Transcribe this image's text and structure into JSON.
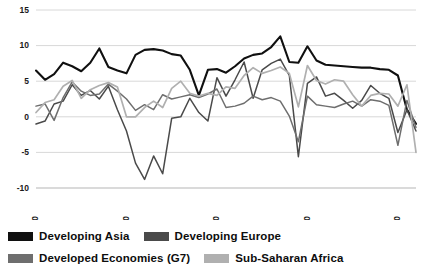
{
  "chart_data": {
    "type": "line",
    "title": "",
    "subtitle": "",
    "xlabel": "",
    "ylabel": "",
    "xlim": [
      1980,
      2022
    ],
    "ylim": [
      -10,
      15
    ],
    "grid": "horizontal",
    "legend_position": "bottom",
    "yticks": [
      15,
      10,
      5,
      0,
      -5,
      -10
    ],
    "ytick_labels": [
      "15",
      "10",
      "5",
      "0",
      "-5",
      "-10"
    ],
    "xticks": [
      1980,
      1990,
      2000,
      2010,
      2020
    ],
    "xtick_labels": [
      "1980",
      "1990",
      "2000",
      "2010",
      "2020"
    ],
    "x": [
      1980,
      1981,
      1982,
      1983,
      1984,
      1985,
      1986,
      1987,
      1988,
      1989,
      1990,
      1991,
      1992,
      1993,
      1994,
      1995,
      1996,
      1997,
      1998,
      1999,
      2000,
      2001,
      2002,
      2003,
      2004,
      2005,
      2006,
      2007,
      2008,
      2009,
      2010,
      2011,
      2012,
      2013,
      2014,
      2015,
      2016,
      2017,
      2018,
      2019,
      2020,
      2021,
      2022
    ],
    "series": [
      {
        "name": "Developing Asia",
        "color": "#101010",
        "width": 2.1,
        "values": [
          6.5,
          5.2,
          6.0,
          7.6,
          7.1,
          6.4,
          7.6,
          9.6,
          7.0,
          6.5,
          6.1,
          8.7,
          9.4,
          9.5,
          9.3,
          8.8,
          8.6,
          6.6,
          3.0,
          6.6,
          6.7,
          6.2,
          7.1,
          8.2,
          8.7,
          8.9,
          9.8,
          11.3,
          7.7,
          7.6,
          9.9,
          7.9,
          7.3,
          7.2,
          7.1,
          7.0,
          6.9,
          6.9,
          6.7,
          6.6,
          5.8,
          1.0,
          -1.0
        ]
      },
      {
        "name": "Developing Europe",
        "color": "#4a4a4a",
        "width": 1.5,
        "values": [
          -1.0,
          -0.6,
          1.8,
          2.2,
          4.5,
          3.0,
          3.7,
          2.5,
          4.3,
          1.0,
          -2.0,
          -6.5,
          -8.8,
          -5.5,
          -8.0,
          -0.2,
          0.0,
          2.6,
          0.6,
          -0.6,
          5.5,
          2.9,
          5.2,
          7.7,
          2.6,
          6.6,
          7.5,
          8.1,
          5.8,
          -5.6,
          4.7,
          5.6,
          2.9,
          3.3,
          2.3,
          1.2,
          2.3,
          4.4,
          3.3,
          2.6,
          -2.2,
          1.0,
          -2.0
        ]
      },
      {
        "name": "Developed Economies (G7)",
        "color": "#6e6e6e",
        "width": 1.5,
        "values": [
          1.5,
          1.8,
          -0.5,
          2.7,
          4.9,
          3.6,
          3.0,
          3.2,
          4.6,
          3.6,
          2.5,
          0.9,
          1.7,
          1.0,
          3.1,
          2.5,
          2.8,
          3.1,
          2.7,
          3.2,
          3.9,
          1.3,
          1.5,
          1.9,
          2.9,
          2.4,
          2.7,
          2.2,
          0.1,
          -3.5,
          2.9,
          1.7,
          1.5,
          1.3,
          1.8,
          2.2,
          1.5,
          2.4,
          2.2,
          1.6,
          -4.0,
          2.3,
          -1.5
        ]
      },
      {
        "name": "Sub-Saharan Africa",
        "color": "#b0b0b0",
        "width": 1.7,
        "values": [
          0.6,
          2.0,
          2.4,
          4.3,
          5.1,
          2.6,
          3.8,
          4.4,
          4.8,
          4.2,
          0.0,
          0.0,
          1.3,
          2.2,
          1.3,
          4.0,
          5.0,
          3.3,
          2.9,
          3.3,
          3.0,
          4.2,
          4.0,
          5.8,
          6.9,
          6.1,
          6.5,
          7.0,
          6.1,
          1.4,
          7.2,
          5.1,
          4.6,
          5.2,
          5.0,
          3.1,
          1.5,
          3.0,
          3.3,
          3.2,
          1.5,
          4.5,
          -5.0
        ]
      }
    ]
  },
  "legend": {
    "rows": [
      [
        {
          "label": "Developing Asia",
          "color": "#101010",
          "series": "developing-asia"
        },
        {
          "label": "Developing Europe",
          "color": "#4a4a4a",
          "series": "developing-europe"
        }
      ],
      [
        {
          "label": "Developed Economies (G7)",
          "color": "#6e6e6e",
          "series": "developed-economies-g7"
        },
        {
          "label": "Sub-Saharan Africa",
          "color": "#b0b0b0",
          "series": "sub-saharan-africa"
        }
      ]
    ]
  }
}
